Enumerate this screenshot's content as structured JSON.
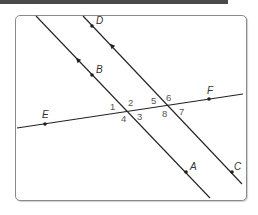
{
  "diagram": {
    "colors": {
      "line": "#222222",
      "point_label": "#333333",
      "angle_label": "#555555",
      "frame": "#8a8a8a",
      "topbar": "#4a4a4a"
    },
    "lines": [
      {
        "name": "line-BA",
        "from": [
          36,
          16
        ],
        "to": [
          210,
          198
        ],
        "parallel_arrow": [
          78,
          60
        ]
      },
      {
        "name": "line-DC",
        "from": [
          83,
          16
        ],
        "to": [
          242,
          184
        ],
        "parallel_arrow": [
          112,
          46
        ]
      },
      {
        "name": "transversal-EF",
        "from": [
          17,
          128
        ],
        "to": [
          243,
          94
        ]
      }
    ],
    "points": [
      {
        "label": "D",
        "x": 92,
        "y": 26,
        "lx": 96,
        "ly": 24
      },
      {
        "label": "B",
        "x": 92,
        "y": 75,
        "lx": 96,
        "ly": 73
      },
      {
        "label": "E",
        "x": 45,
        "y": 124,
        "lx": 42,
        "ly": 118
      },
      {
        "label": "F",
        "x": 209,
        "y": 99,
        "lx": 207,
        "ly": 94
      },
      {
        "label": "A",
        "x": 186,
        "y": 172,
        "lx": 190,
        "ly": 170
      },
      {
        "label": "C",
        "x": 232,
        "y": 172,
        "lx": 234,
        "ly": 170
      }
    ],
    "angles": [
      {
        "label": "1",
        "x": 110,
        "y": 110
      },
      {
        "label": "2",
        "x": 128,
        "y": 106
      },
      {
        "label": "3",
        "x": 137,
        "y": 120
      },
      {
        "label": "4",
        "x": 121,
        "y": 122
      },
      {
        "label": "5",
        "x": 151,
        "y": 104
      },
      {
        "label": "6",
        "x": 166,
        "y": 101
      },
      {
        "label": "7",
        "x": 179,
        "y": 115
      },
      {
        "label": "8",
        "x": 162,
        "y": 117
      }
    ]
  }
}
